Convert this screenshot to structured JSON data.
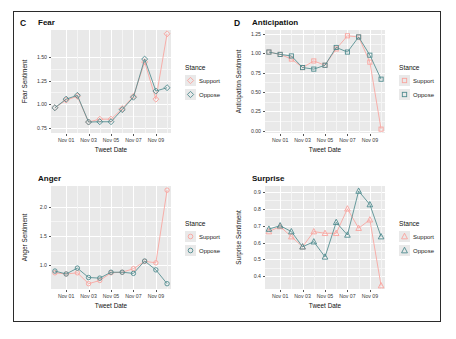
{
  "figure": {
    "background": "#ffffff",
    "border_color": "#2b2b2b",
    "panel_background": "#e9e9e9",
    "grid_color": "#ffffff"
  },
  "colors": {
    "support": "#F8766D",
    "oppose": "#00BFC4",
    "support_light": "#f9a39d",
    "oppose_dark": "#4f8b8e"
  },
  "legend": {
    "title": "Stance",
    "items": [
      {
        "label": "Support",
        "color_key": "support"
      },
      {
        "label": "Oppose",
        "color_key": "oppose"
      }
    ]
  },
  "panels": [
    {
      "tag": "C",
      "title": "Fear",
      "marker": "diamond",
      "chart_index": 0
    },
    {
      "tag": "D",
      "title": "Anticipation",
      "marker": "square",
      "chart_index": 1
    },
    {
      "tag": "",
      "title": "Anger",
      "marker": "circle",
      "chart_index": 2
    },
    {
      "tag": "",
      "title": "Surprise",
      "marker": "triangle",
      "chart_index": 3
    }
  ],
  "chart_data": [
    {
      "type": "line",
      "title": "Fear",
      "panel_tag": "C",
      "xlabel": "Tweet Date",
      "ylabel": "Fear Sentiment",
      "marker": "diamond",
      "grid": true,
      "legend_position": "right",
      "legend_title": "Stance",
      "x": [
        "Oct 31",
        "Nov 01",
        "Nov 02",
        "Nov 03",
        "Nov 04",
        "Nov 05",
        "Nov 06",
        "Nov 07",
        "Nov 08",
        "Nov 09",
        "Nov 10"
      ],
      "xtick_labels": [
        "Nov 01",
        "Nov 03",
        "Nov 05",
        "Nov 07",
        "Nov 09"
      ],
      "xtick_values": [
        1,
        3,
        5,
        7,
        9
      ],
      "ytick_labels": [
        "0.75",
        "1.00",
        "1.25",
        "1.50"
      ],
      "ytick_values": [
        0.75,
        1.0,
        1.25,
        1.5
      ],
      "ylim": [
        0.7,
        1.78
      ],
      "xlim": [
        -0.35,
        10.35
      ],
      "series": [
        {
          "name": "Support",
          "values": [
            0.965,
            1.045,
            1.085,
            0.815,
            0.845,
            0.845,
            0.955,
            1.085,
            1.445,
            1.055,
            1.74
          ]
        },
        {
          "name": "Oppose",
          "values": [
            0.965,
            1.055,
            1.095,
            0.815,
            0.818,
            0.818,
            0.945,
            1.075,
            1.475,
            1.14,
            1.175
          ]
        }
      ]
    },
    {
      "type": "line",
      "title": "Anticipation",
      "panel_tag": "D",
      "xlabel": "Tweet Date",
      "ylabel": "Anticipation Sentiment",
      "marker": "square",
      "grid": true,
      "legend_position": "right",
      "legend_title": "Stance",
      "x": [
        "Oct 31",
        "Nov 01",
        "Nov 02",
        "Nov 03",
        "Nov 04",
        "Nov 05",
        "Nov 06",
        "Nov 07",
        "Nov 08",
        "Nov 09",
        "Nov 10"
      ],
      "xtick_labels": [
        "Nov 01",
        "Nov 03",
        "Nov 05",
        "Nov 07",
        "Nov 09"
      ],
      "xtick_values": [
        1,
        3,
        5,
        7,
        9
      ],
      "ytick_labels": [
        "0.00",
        "0.25",
        "0.50",
        "0.75",
        "1.00",
        "1.25"
      ],
      "ytick_values": [
        0.0,
        0.25,
        0.5,
        0.75,
        1.0,
        1.25
      ],
      "ylim": [
        -0.03,
        1.3
      ],
      "xlim": [
        -0.35,
        10.35
      ],
      "series": [
        {
          "name": "Support",
          "values": [
            1.015,
            0.985,
            0.925,
            0.815,
            0.9,
            0.845,
            1.055,
            1.225,
            1.21,
            0.885,
            0.02
          ]
        },
        {
          "name": "Oppose",
          "values": [
            1.015,
            0.985,
            0.965,
            0.815,
            0.795,
            0.845,
            1.075,
            1.015,
            1.21,
            0.975,
            0.665
          ]
        }
      ]
    },
    {
      "type": "line",
      "title": "Anger",
      "panel_tag": "",
      "xlabel": "Tweet Date",
      "ylabel": "Anger Sentiment",
      "marker": "circle",
      "grid": true,
      "legend_position": "right",
      "legend_title": "Stance",
      "x": [
        "Oct 31",
        "Nov 01",
        "Nov 02",
        "Nov 03",
        "Nov 04",
        "Nov 05",
        "Nov 06",
        "Nov 07",
        "Nov 08",
        "Nov 09",
        "Nov 10"
      ],
      "xtick_labels": [
        "Nov 01",
        "Nov 03",
        "Nov 05",
        "Nov 07",
        "Nov 09"
      ],
      "xtick_values": [
        1,
        3,
        5,
        7,
        9
      ],
      "ytick_labels": [
        "1.0",
        "1.5",
        "2.0"
      ],
      "ytick_values": [
        1.0,
        1.5,
        2.0
      ],
      "ylim": [
        0.6,
        2.35
      ],
      "xlim": [
        -0.35,
        10.35
      ],
      "series": [
        {
          "name": "Support",
          "values": [
            0.875,
            0.855,
            0.875,
            0.69,
            0.745,
            0.875,
            0.885,
            0.945,
            1.07,
            1.045,
            2.28
          ]
        },
        {
          "name": "Oppose",
          "values": [
            0.905,
            0.855,
            0.955,
            0.795,
            0.785,
            0.885,
            0.885,
            0.865,
            1.075,
            0.925,
            0.69
          ]
        }
      ]
    },
    {
      "type": "line",
      "title": "Surprise",
      "panel_tag": "",
      "xlabel": "Tweet Date",
      "ylabel": "Surprise Sentiment",
      "marker": "triangle",
      "grid": true,
      "legend_position": "right",
      "legend_title": "Stance",
      "x": [
        "Oct 31",
        "Nov 01",
        "Nov 02",
        "Nov 03",
        "Nov 04",
        "Nov 05",
        "Nov 06",
        "Nov 07",
        "Nov 08",
        "Nov 09",
        "Nov 10"
      ],
      "xtick_labels": [
        "Nov 01",
        "Nov 03",
        "Nov 05",
        "Nov 07",
        "Nov 09"
      ],
      "xtick_values": [
        1,
        3,
        5,
        7,
        9
      ],
      "ytick_labels": [
        "0.4",
        "0.5",
        "0.6",
        "0.7",
        "0.8",
        "0.9"
      ],
      "ytick_values": [
        0.4,
        0.5,
        0.6,
        0.7,
        0.8,
        0.9
      ],
      "ylim": [
        0.325,
        0.935
      ],
      "xlim": [
        -0.35,
        10.35
      ],
      "series": [
        {
          "name": "Support",
          "values": [
            0.665,
            0.695,
            0.635,
            0.575,
            0.665,
            0.655,
            0.655,
            0.8,
            0.685,
            0.735,
            0.345
          ]
        },
        {
          "name": "Oppose",
          "values": [
            0.68,
            0.7,
            0.665,
            0.575,
            0.605,
            0.515,
            0.72,
            0.645,
            0.905,
            0.825,
            0.635
          ]
        }
      ]
    }
  ]
}
